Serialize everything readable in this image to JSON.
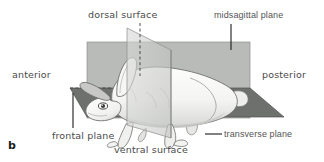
{
  "figure": {
    "panel_letter": "b",
    "labels": {
      "dorsal_surface": "dorsal surface",
      "midsagittal_plane": "midsagittal plane",
      "anterior": "anterior",
      "posterior": "posterior",
      "frontal_plane": "frontal plane",
      "transverse_plane": "transverse plane",
      "ventral_surface": "ventral surface"
    },
    "colors": {
      "background": "#ffffff",
      "sagittal_plane_fill": "#b9bbb9",
      "frontal_plane_fill": "#6e706e",
      "transverse_plane_fill": "#cdcfcd",
      "animal_body": "#f2f2f0",
      "animal_shadow": "#c3c4c2",
      "outline": "#6a6a6a",
      "leader_line": "#1a1a1a",
      "label_text": "#4a4a4a"
    },
    "planes": [
      {
        "name": "midsagittal plane",
        "orientation": "vertical-longitudinal",
        "leader": "solid"
      },
      {
        "name": "frontal plane",
        "orientation": "horizontal",
        "leader": "solid"
      },
      {
        "name": "transverse plane",
        "orientation": "vertical-cross-section",
        "leader": "solid"
      }
    ],
    "surfaces": [
      {
        "name": "dorsal surface",
        "position": "top",
        "leader": "dashed"
      },
      {
        "name": "ventral surface",
        "position": "bottom",
        "leader": "none"
      }
    ],
    "axes": [
      {
        "name": "anterior",
        "position": "left"
      },
      {
        "name": "posterior",
        "position": "right"
      }
    ]
  }
}
